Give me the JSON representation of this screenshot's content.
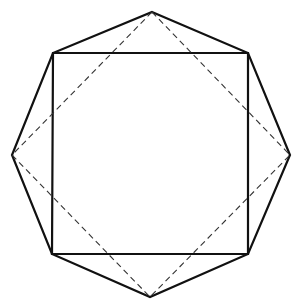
{
  "figure": {
    "colors": {
      "line": "#111111",
      "dashed": "#333333",
      "background": "#ffffff"
    },
    "octagon": {
      "points": [
        [
          152,
          12
        ],
        [
          248,
          53
        ],
        [
          290,
          155
        ],
        [
          248,
          254
        ],
        [
          150,
          297
        ],
        [
          52,
          254
        ],
        [
          12,
          155
        ],
        [
          53,
          53
        ]
      ]
    },
    "square_solid": {
      "points": [
        [
          53,
          53
        ],
        [
          248,
          53
        ],
        [
          248,
          254
        ],
        [
          52,
          254
        ]
      ]
    },
    "square_dashed": {
      "points": [
        [
          152,
          12
        ],
        [
          290,
          155
        ],
        [
          150,
          297
        ],
        [
          12,
          155
        ]
      ]
    }
  }
}
